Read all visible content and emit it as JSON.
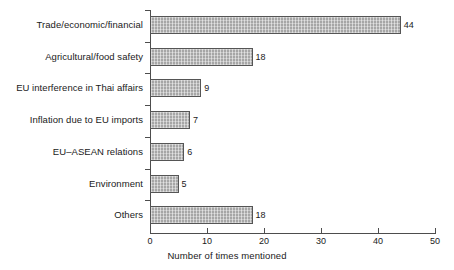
{
  "chart_data": {
    "type": "bar",
    "orientation": "horizontal",
    "title": "",
    "xlabel": "Number of times mentioned",
    "ylabel": "",
    "xlim": [
      0,
      50
    ],
    "xticks": [
      0,
      10,
      20,
      30,
      40,
      50
    ],
    "grid": false,
    "legend": null,
    "categories": [
      "Trade/economic/financial",
      "Agricultural/food safety",
      "EU interference in Thai affairs",
      "Inflation due to EU imports",
      "EU–ASEAN relations",
      "Environment",
      "Others"
    ],
    "values": [
      44,
      18,
      9,
      7,
      6,
      5,
      18
    ],
    "value_labels": [
      "44",
      "18",
      "9",
      "7",
      "6",
      "5",
      "18"
    ],
    "bar_fill_color": "#a6a6a6",
    "bar_edge_color": "#555555",
    "axis_color": "#4d4d4d",
    "background_color": "#ffffff"
  }
}
